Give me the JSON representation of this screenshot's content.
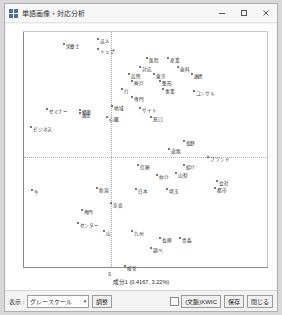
{
  "window": {
    "title": "単語画像・対応分析",
    "icon": "grid-app-icon",
    "minimize_label": "–",
    "maximize_label": "□",
    "close_label": "✕"
  },
  "plot": {
    "xlabel": "成分1 (0.4167, 3.22%)",
    "ylabel": "成分2 (0.3942, 2.87%)",
    "xtick_zero": "0"
  },
  "toolbar": {
    "display_label": "表示 :",
    "palette_value": "グレースケール",
    "palette_arrow": "▾",
    "adjust_label": "調整",
    "checkbox_label": "(文脈)KWIC",
    "save_label": "保存",
    "close_label": "閉じる"
  },
  "chart_data": {
    "type": "scatter",
    "title": "",
    "xlabel": "成分1 (0.4167, 3.22%)",
    "ylabel": "成分2 (0.3942, 2.87%)",
    "xlim": [
      -0.5,
      0.9
    ],
    "ylim": [
      -0.7,
      0.8
    ],
    "grid": true,
    "legend": false,
    "origin_lines": {
      "x": 0.0,
      "y": 0.0
    },
    "points": [
      {
        "label": "栄養士",
        "x": 0.055,
        "y": 0.7,
        "px": 62,
        "py": 28
      },
      {
        "label": "法人",
        "x": 0.175,
        "y": 0.735,
        "px": 97,
        "py": 22
      },
      {
        "label": "トップ",
        "x": 0.175,
        "y": 0.685,
        "px": 97,
        "py": 33
      },
      {
        "label": "医院",
        "x": 0.355,
        "y": 0.64,
        "px": 146,
        "py": 43
      },
      {
        "label": "産業",
        "x": 0.43,
        "y": 0.64,
        "px": 167,
        "py": 43
      },
      {
        "label": "対応",
        "x": 0.33,
        "y": 0.59,
        "px": 139,
        "py": 54
      },
      {
        "label": "歯科",
        "x": 0.465,
        "y": 0.59,
        "px": 177,
        "py": 54
      },
      {
        "label": "近所",
        "x": 0.29,
        "y": 0.56,
        "px": 128,
        "py": 61
      },
      {
        "label": "東京",
        "x": 0.38,
        "y": 0.56,
        "px": 153,
        "py": 61
      },
      {
        "label": "連携",
        "x": 0.515,
        "y": 0.56,
        "px": 191,
        "py": 61
      },
      {
        "label": "神戸",
        "x": 0.3,
        "y": 0.52,
        "px": 131,
        "py": 70
      },
      {
        "label": "整形",
        "x": 0.4,
        "y": 0.52,
        "px": 159,
        "py": 70
      },
      {
        "label": "行",
        "x": 0.265,
        "y": 0.48,
        "px": 121,
        "py": 79
      },
      {
        "label": "事業",
        "x": 0.41,
        "y": 0.48,
        "px": 162,
        "py": 79
      },
      {
        "label": "コンサル",
        "x": 0.52,
        "y": 0.47,
        "px": 193,
        "py": 81
      },
      {
        "label": "専門",
        "x": 0.3,
        "y": 0.44,
        "px": 131,
        "py": 88
      },
      {
        "label": "地域",
        "x": 0.23,
        "y": 0.395,
        "px": 111,
        "py": 98
      },
      {
        "label": "サイト",
        "x": 0.33,
        "y": 0.385,
        "px": 139,
        "py": 100
      },
      {
        "label": "黄金",
        "x": 0.11,
        "y": 0.36,
        "px": 78,
        "py": 106
      },
      {
        "label": "心臓",
        "x": 0.21,
        "y": 0.34,
        "px": 106,
        "py": 110
      },
      {
        "label": "窓口",
        "x": 0.37,
        "y": 0.34,
        "px": 150,
        "py": 110
      },
      {
        "label": "セミナー",
        "x": -0.31,
        "y": 0.38,
        "px": 45,
        "py": 101
      },
      {
        "label": "経理",
        "x": -0.12,
        "y": 0.375,
        "px": 78,
        "py": 102
      },
      {
        "label": "ビジネス",
        "x": -0.4,
        "y": 0.29,
        "px": 29,
        "py": 121
      },
      {
        "label": "長野",
        "x": 0.48,
        "y": 0.215,
        "px": 183,
        "py": 137
      },
      {
        "label": "道路",
        "x": 0.43,
        "y": 0.175,
        "px": 168,
        "py": 146
      },
      {
        "label": "ブランド",
        "x": 0.57,
        "y": 0.13,
        "px": 208,
        "py": 156
      },
      {
        "label": "信頼",
        "x": 0.32,
        "y": 0.095,
        "px": 137,
        "py": 164
      },
      {
        "label": "紹介",
        "x": 0.48,
        "y": 0.095,
        "px": 183,
        "py": 164
      },
      {
        "label": "仲介",
        "x": 0.385,
        "y": 0.04,
        "px": 156,
        "py": 176
      },
      {
        "label": "山梨",
        "x": 0.45,
        "y": 0.05,
        "px": 175,
        "py": 174
      },
      {
        "label": "会社",
        "x": 0.6,
        "y": 0.01,
        "px": 217,
        "py": 183
      },
      {
        "label": "都市",
        "x": 0.595,
        "y": -0.03,
        "px": 215,
        "py": 191
      },
      {
        "label": "日本",
        "x": 0.31,
        "y": -0.035,
        "px": 135,
        "py": 192
      },
      {
        "label": "埼玉",
        "x": 0.42,
        "y": -0.035,
        "px": 166,
        "py": 192
      },
      {
        "label": "新潟",
        "x": 0.17,
        "y": -0.03,
        "px": 96,
        "py": 191
      },
      {
        "label": "牛",
        "x": -0.4,
        "y": -0.04,
        "px": 30,
        "py": 193
      },
      {
        "label": "奈良",
        "x": 0.225,
        "y": -0.11,
        "px": 110,
        "py": 208
      },
      {
        "label": "専門",
        "x": 0.12,
        "y": -0.14,
        "px": 80,
        "py": 215
      },
      {
        "label": "センター",
        "x": 0.105,
        "y": -0.21,
        "px": 76,
        "py": 230
      },
      {
        "label": "山",
        "x": 0.2,
        "y": -0.25,
        "px": 103,
        "py": 239
      },
      {
        "label": "九州",
        "x": 0.3,
        "y": -0.25,
        "px": 131,
        "py": 239
      },
      {
        "label": "長崎",
        "x": 0.4,
        "y": -0.29,
        "px": 159,
        "py": 247
      },
      {
        "label": "青森",
        "x": 0.47,
        "y": -0.29,
        "px": 179,
        "py": 247
      },
      {
        "label": "調べ",
        "x": 0.37,
        "y": -0.345,
        "px": 150,
        "py": 259
      },
      {
        "label": "岐阜",
        "x": 0.275,
        "y": -0.44,
        "px": 124,
        "py": 279
      }
    ]
  }
}
